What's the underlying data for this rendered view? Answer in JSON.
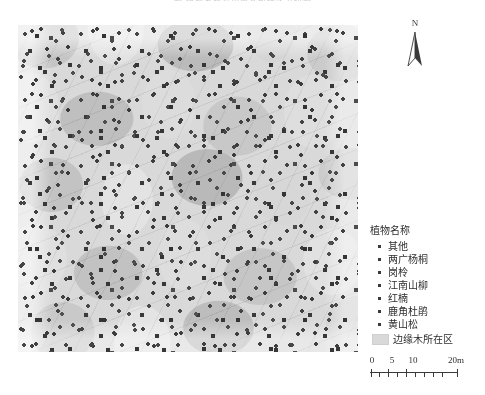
{
  "figure": {
    "title": "图 植物名称及边缘木所在区分布图",
    "title_visible": false
  },
  "map": {
    "name": "forest-plot-map",
    "description": "样地植物分布图（泰森多边形与单木点位）",
    "polygon_fill": "#d6d6d6",
    "point_color": "#3c3c3c",
    "background": "#ebebeb"
  },
  "north_arrow": {
    "label": "N"
  },
  "legend": {
    "title": "植物名称",
    "items": [
      {
        "label": "其他",
        "marker": "dot"
      },
      {
        "label": "两广杨桐",
        "marker": "dot"
      },
      {
        "label": "岗柃",
        "marker": "dot"
      },
      {
        "label": "江南山柳",
        "marker": "dot"
      },
      {
        "label": "红楠",
        "marker": "dot"
      },
      {
        "label": "鹿角杜鹃",
        "marker": "dot"
      },
      {
        "label": "黄山松",
        "marker": "dot"
      }
    ],
    "patch": {
      "label": "边缘木所在区",
      "color": "#d9d9d9"
    }
  },
  "scale_bar": {
    "ticks": [
      {
        "label": "0",
        "pos": 0
      },
      {
        "label": "5",
        "pos": 20
      },
      {
        "label": "10",
        "pos": 40
      },
      {
        "label": "20m",
        "pos": 88
      }
    ],
    "unit": "m",
    "max_value": 20
  }
}
